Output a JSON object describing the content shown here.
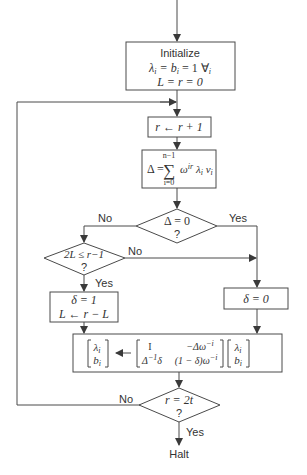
{
  "diagram": {
    "nodes": {
      "init": {
        "title": "Initialize",
        "line1": "λi = bi = 1   ∀i",
        "line2": "L = r = 0"
      },
      "increment": {
        "text": "r ← r + 1"
      },
      "delta": {
        "lhs": "Δ =",
        "sum_upper": "n−1",
        "sum_lower": "i=0",
        "sum_symbol": "∑",
        "term": "ωir λi vi"
      },
      "decision_delta": {
        "line1": "Δ = 0",
        "line2": "?"
      },
      "decision_L": {
        "line1": "2L ≤ r−1",
        "line2": "?"
      },
      "set_delta_one": {
        "line1": "δ = 1",
        "line2": "L ← r − L"
      },
      "set_delta_zero": {
        "text": "δ = 0"
      },
      "update": {
        "lhs_top": "λi",
        "lhs_bottom": "bi",
        "arrow": "←",
        "m11": "I",
        "m12": "−Δω−i",
        "m21": "Δ−1δ",
        "m22": "(1 − δ)ω−i",
        "rhs_top": "λi",
        "rhs_bottom": "bi"
      },
      "decision_r": {
        "line1": "r = 2t",
        "line2": "?"
      },
      "halt": {
        "text": "Halt"
      }
    },
    "edge_labels": {
      "delta_no": "No",
      "delta_yes": "Yes",
      "L_no": "No",
      "L_yes": "Yes",
      "r_no": "No",
      "r_yes": "Yes"
    },
    "colors": {
      "line": "#4a4a4a",
      "text": "#333333",
      "background": "#ffffff"
    }
  }
}
